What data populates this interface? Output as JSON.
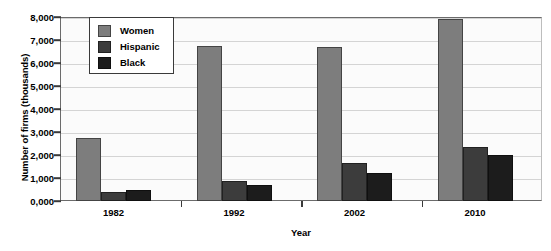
{
  "chart_data": {
    "type": "bar",
    "title": "",
    "xlabel": "Year",
    "ylabel": "Number of firms (thousands)",
    "categories": [
      "1982",
      "1992",
      "2002",
      "2010"
    ],
    "series": [
      {
        "name": "Women",
        "color": "#7d7d7d",
        "values": [
          2740,
          6740,
          6700,
          7900
        ]
      },
      {
        "name": "Hispanic",
        "color": "#3c3c3c",
        "values": [
          390,
          870,
          1650,
          2350
        ]
      },
      {
        "name": "Black",
        "color": "#1c1c1c",
        "values": [
          480,
          700,
          1220,
          2000
        ]
      }
    ],
    "ylim": [
      0,
      8000
    ],
    "ytick_labels": [
      "0,000",
      "1,000",
      "2,000",
      "3,000",
      "4,000",
      "5,000",
      "6,000",
      "7,000",
      "8,000"
    ],
    "ytick_values": [
      0,
      1000,
      2000,
      3000,
      4000,
      5000,
      6000,
      7000,
      8000
    ],
    "grid": true,
    "legend_position": "top-left-inside"
  }
}
